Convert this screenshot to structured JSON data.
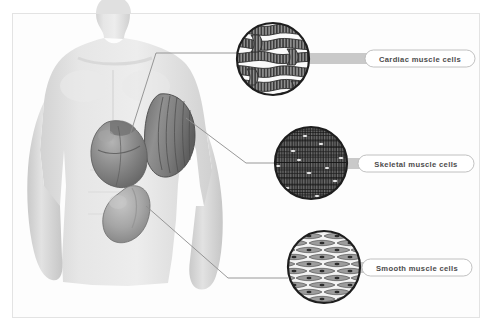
{
  "figure": {
    "background_color": "#ffffff",
    "frame_color": "#e3e3e3",
    "body_figure": {
      "name": "human-torso",
      "skin_color": "#e0e0e0",
      "organs": [
        {
          "name": "heart",
          "label": "Heart",
          "color": "#8f8f8f"
        },
        {
          "name": "biceps",
          "label": "Skeletal muscle",
          "color": "#8a8a8a"
        },
        {
          "name": "stomach",
          "label": "Stomach",
          "color": "#a8a8a8"
        }
      ]
    },
    "callouts": [
      {
        "id": "cardiac",
        "label": "Cardiac muscle cells",
        "circle": {
          "cx": 273,
          "cy": 59,
          "r": 37
        },
        "tissue_pattern": "branching-striated-fibers",
        "bar_color": "#c9c9c9",
        "pill_fill": "#ffffff",
        "pill_stroke": "#b9b9b9",
        "text_color": "#4c4c4c",
        "source_organ": "heart"
      },
      {
        "id": "skeletal",
        "label": "Skeletal muscle cells",
        "circle": {
          "cx": 311,
          "cy": 163,
          "r": 37
        },
        "tissue_pattern": "parallel-striated-multinucleated",
        "bar_color": "#c9c9c9",
        "pill_fill": "#ffffff",
        "pill_stroke": "#b9b9b9",
        "text_color": "#4c4c4c",
        "source_organ": "biceps"
      },
      {
        "id": "smooth",
        "label": "Smooth muscle cells",
        "circle": {
          "cx": 324,
          "cy": 267,
          "r": 37
        },
        "tissue_pattern": "spindle-shaped-single-nucleus",
        "bar_color": "#c9c9c9",
        "pill_fill": "#ffffff",
        "pill_stroke": "#b9b9b9",
        "text_color": "#4c4c4c",
        "source_organ": "stomach"
      }
    ],
    "leader_lines": [
      {
        "name": "leader-cardiac",
        "color": "#8c8c8c"
      },
      {
        "name": "leader-skeletal",
        "color": "#8c8c8c"
      },
      {
        "name": "leader-smooth",
        "color": "#8c8c8c"
      }
    ]
  }
}
